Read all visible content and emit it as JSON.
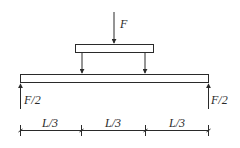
{
  "diagram": {
    "type": "four-point bending beam schematic",
    "colors": {
      "line": "#2a2a2a",
      "background": "#ffffff"
    },
    "applied_load": {
      "label": "F"
    },
    "loading_plate": {
      "label": ""
    },
    "load_points": [
      {
        "label": ""
      },
      {
        "label": ""
      }
    ],
    "beam": {
      "label": ""
    },
    "reactions": [
      {
        "label": "F/2"
      },
      {
        "label": "F/2"
      }
    ],
    "dimensions": [
      {
        "label": "L/3"
      },
      {
        "label": "L/3"
      },
      {
        "label": "L/3"
      }
    ]
  }
}
